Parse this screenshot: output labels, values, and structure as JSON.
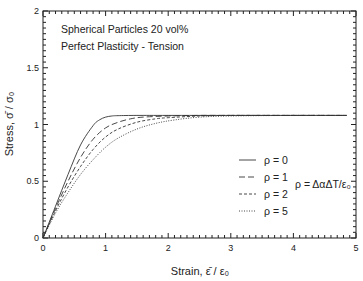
{
  "chart_data": {
    "type": "line",
    "title": "",
    "annotations": [
      "Spherical Particles 20 vol%",
      "Perfect Plasticity - Tension"
    ],
    "xlabel": "Strain,  ε̄ / ε₀",
    "ylabel": "Stress,  σ̄ / σ₀",
    "xlim": [
      0,
      5
    ],
    "ylim": [
      0,
      2
    ],
    "x_ticks": [
      "0",
      "1",
      "2",
      "3",
      "4",
      "5"
    ],
    "y_ticks": [
      "0",
      "0.5",
      "1",
      "1.5",
      "2"
    ],
    "grid": false,
    "legend_position": "center-right",
    "legend_note": "ρ = ΔαΔT/ε₀",
    "series": [
      {
        "name": "ρ = 0",
        "style": "solid",
        "x": [
          0,
          0.2,
          0.4,
          0.6,
          0.8,
          0.9,
          1.0,
          1.1,
          1.2,
          1.5,
          2.0,
          3.0,
          4.0,
          4.85
        ],
        "y": [
          0,
          0.28,
          0.56,
          0.82,
          0.99,
          1.04,
          1.065,
          1.075,
          1.078,
          1.08,
          1.08,
          1.08,
          1.08,
          1.08
        ]
      },
      {
        "name": "ρ = 1",
        "style": "long-dash",
        "x": [
          0,
          0.2,
          0.4,
          0.6,
          0.8,
          1.0,
          1.2,
          1.4,
          1.6,
          2.0,
          2.5,
          3.0,
          4.0,
          4.85
        ],
        "y": [
          0,
          0.26,
          0.5,
          0.71,
          0.87,
          0.97,
          1.02,
          1.05,
          1.065,
          1.075,
          1.08,
          1.08,
          1.08,
          1.08
        ]
      },
      {
        "name": "ρ = 2",
        "style": "short-dash",
        "x": [
          0,
          0.2,
          0.4,
          0.6,
          0.8,
          1.0,
          1.2,
          1.5,
          1.8,
          2.0,
          2.5,
          3.0,
          4.0,
          4.85
        ],
        "y": [
          0,
          0.24,
          0.45,
          0.63,
          0.78,
          0.89,
          0.96,
          1.02,
          1.05,
          1.06,
          1.075,
          1.08,
          1.08,
          1.08
        ]
      },
      {
        "name": "ρ = 5",
        "style": "dotted",
        "x": [
          0,
          0.2,
          0.4,
          0.6,
          0.8,
          1.0,
          1.2,
          1.5,
          1.8,
          2.1,
          2.5,
          3.0,
          4.0,
          4.85
        ],
        "y": [
          0,
          0.22,
          0.4,
          0.56,
          0.69,
          0.8,
          0.88,
          0.96,
          1.01,
          1.04,
          1.065,
          1.075,
          1.08,
          1.08
        ]
      }
    ]
  }
}
